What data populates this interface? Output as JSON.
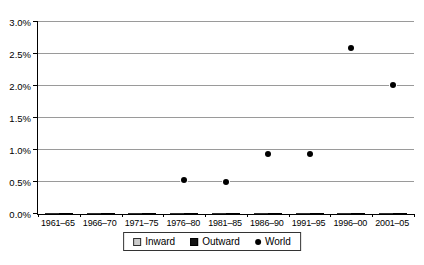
{
  "chart_data": {
    "type": "bar",
    "subtype": "grouped bars with scatter overlay",
    "title": "",
    "xlabel": "",
    "ylabel": "",
    "ylim": [
      0,
      3.0
    ],
    "y_tick_step": 0.5,
    "y_tick_labels": [
      "0.0%",
      "0.5%",
      "1.0%",
      "1.5%",
      "2.0%",
      "2.5%",
      "3.0%"
    ],
    "grid": "horizontal",
    "legend_position": "bottom-center",
    "categories": [
      "1961–65",
      "1966–70",
      "1971–75",
      "1976–80",
      "1981–85",
      "1986–90",
      "1991–95",
      "1996–00",
      "2001–05"
    ],
    "series": [
      {
        "name": "Inward",
        "type": "bar",
        "values": [
          0.27,
          0.38,
          0.4,
          0.26,
          0.31,
          0.34,
          0.67,
          2.27,
          2.08
        ]
      },
      {
        "name": "Outward",
        "type": "bar",
        "values": [
          0.06,
          0.09,
          0.13,
          0.15,
          0.2,
          0.5,
          0.66,
          1.51,
          2.69
        ]
      },
      {
        "name": "World",
        "type": "scatter",
        "values": [
          null,
          null,
          null,
          0.53,
          0.5,
          0.93,
          0.93,
          2.6,
          2.02
        ]
      }
    ]
  },
  "colors": {
    "inward_fill": "#cbcbcb",
    "inward_border": "#2e2e2e",
    "outward_fill": "#141414",
    "world_dot": "#000000",
    "world_dot_ring": "#ffffff",
    "gridline": "#9a9a9a",
    "axis": "#000000",
    "background": "#ffffff"
  },
  "legend": {
    "items": [
      {
        "label": "Inward",
        "swatch": "gray-square"
      },
      {
        "label": "Outward",
        "swatch": "black-square"
      },
      {
        "label": "World",
        "swatch": "black-dot"
      }
    ]
  }
}
